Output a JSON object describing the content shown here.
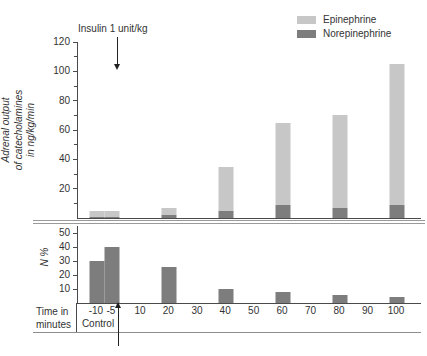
{
  "figure": {
    "legend": [
      {
        "label": "Epinephrine",
        "color": "#c7c7c7"
      },
      {
        "label": "Norepinephrine",
        "color": "#7d7d7d"
      }
    ]
  },
  "chart_data": [
    {
      "type": "bar",
      "stacked": true,
      "ylabel": "Adrenal output of catecholamines in ng/kg/min",
      "ylabel_lines": [
        "Adrenal output",
        "of catecholamines",
        "in ng/kg/min"
      ],
      "annotation": "Insulin 1 unit/kg",
      "annotation_at_x": 0,
      "x": [
        -10,
        -5,
        20,
        40,
        60,
        80,
        100
      ],
      "series": [
        {
          "name": "Norepinephrine",
          "color": "#7d7d7d",
          "values": [
            1,
            1,
            2,
            5,
            9,
            7,
            9
          ]
        },
        {
          "name": "Epinephrine",
          "color": "#c7c7c7",
          "values": [
            4,
            4,
            5,
            30,
            56,
            63,
            96
          ]
        }
      ],
      "totals": [
        5,
        5,
        7,
        35,
        65,
        70,
        105
      ],
      "yticks": [
        20,
        40,
        60,
        80,
        100,
        120
      ],
      "ylim": [
        0,
        120
      ],
      "grid": false,
      "legend_position": "top-right"
    },
    {
      "type": "bar",
      "ylabel": "N %",
      "x": [
        -10,
        -5,
        20,
        40,
        60,
        80,
        100
      ],
      "values": [
        30,
        40,
        26,
        10,
        8,
        6,
        4
      ],
      "bar_color": "#7d7d7d",
      "yticks": [
        10,
        20,
        30,
        40,
        50
      ],
      "ylim": [
        0,
        55
      ],
      "xlabel": "Time in minutes",
      "xlabel_lines": [
        "Time in",
        "minutes"
      ],
      "control_label": "Control",
      "xtick_values": [
        -10,
        -5,
        10,
        20,
        30,
        40,
        50,
        60,
        70,
        80,
        90,
        100
      ],
      "xtick_labels": [
        "-10",
        "-5",
        "10",
        "20",
        "30",
        "40",
        "50",
        "60",
        "70",
        "80",
        "90",
        "100"
      ],
      "grid": false
    }
  ]
}
